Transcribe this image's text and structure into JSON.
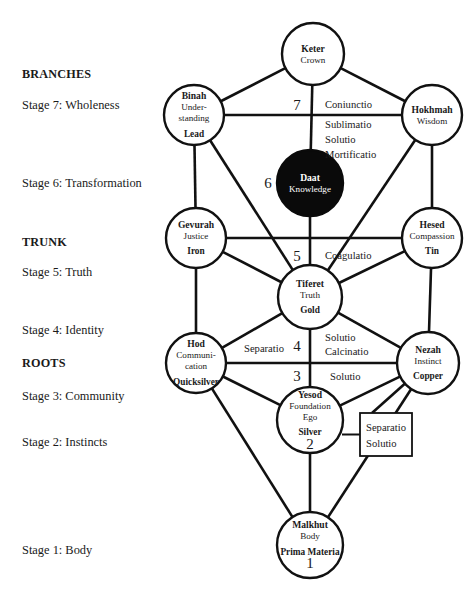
{
  "diagram": {
    "width": 472,
    "height": 589,
    "background_color": "#ffffff",
    "line_color": "#111111"
  },
  "left_panel": {
    "items": [
      {
        "label": "BRANCHES",
        "kind": "section",
        "x": 22,
        "y": 68
      },
      {
        "label": "Stage 7: Wholeness",
        "kind": "stage",
        "x": 22,
        "y": 99
      },
      {
        "label": "Stage 6: Transformation",
        "kind": "stage",
        "x": 22,
        "y": 177
      },
      {
        "label": "TRUNK",
        "kind": "section",
        "x": 22,
        "y": 236
      },
      {
        "label": "Stage 5: Truth",
        "kind": "stage",
        "x": 22,
        "y": 266
      },
      {
        "label": "Stage 4: Identity",
        "kind": "stage",
        "x": 22,
        "y": 324
      },
      {
        "label": "ROOTS",
        "kind": "section",
        "x": 22,
        "y": 357
      },
      {
        "label": "Stage 3: Community",
        "kind": "stage",
        "x": 22,
        "y": 390
      },
      {
        "label": "Stage 2: Instincts",
        "kind": "stage",
        "x": 22,
        "y": 436
      },
      {
        "label": "Stage 1: Body",
        "kind": "stage",
        "x": 22,
        "y": 544
      }
    ]
  },
  "nodes": [
    {
      "id": "keter",
      "name": "Keter",
      "subtitle": "Crown",
      "metal": "",
      "number": "",
      "cx": 313,
      "cy": 54,
      "r": 31,
      "filled": false
    },
    {
      "id": "binah",
      "name": "Binah",
      "subtitle": "Under-\nstanding",
      "metal": "Lead",
      "number": "",
      "cx": 194,
      "cy": 115,
      "r": 30,
      "filled": false
    },
    {
      "id": "hokhmah",
      "name": "Hokhmah",
      "subtitle": "Wisdom",
      "metal": "",
      "number": "",
      "cx": 432,
      "cy": 115,
      "r": 30,
      "filled": false
    },
    {
      "id": "daat",
      "name": "Daat",
      "subtitle": "Knowledge",
      "metal": "",
      "number": "",
      "cx": 310,
      "cy": 183,
      "r": 33,
      "filled": true
    },
    {
      "id": "gevurah",
      "name": "Gevurah",
      "subtitle": "Justice",
      "metal": "Iron",
      "number": "",
      "cx": 196,
      "cy": 238,
      "r": 30,
      "filled": false
    },
    {
      "id": "hesed",
      "name": "Hesed",
      "subtitle": "Compassion",
      "metal": "Tin",
      "number": "",
      "cx": 432,
      "cy": 238,
      "r": 30,
      "filled": false
    },
    {
      "id": "tiferet",
      "name": "Tiferet",
      "subtitle": "Truth",
      "metal": "Gold",
      "number": "",
      "cx": 310,
      "cy": 297,
      "r": 32,
      "filled": false
    },
    {
      "id": "hod",
      "name": "Hod",
      "subtitle": "Communi-\ncation",
      "metal": "Quicksilver",
      "number": "",
      "cx": 196,
      "cy": 363,
      "r": 30,
      "filled": false
    },
    {
      "id": "nezah",
      "name": "Nezah",
      "subtitle": "Instinct",
      "metal": "Copper",
      "number": "",
      "cx": 428,
      "cy": 363,
      "r": 31,
      "filled": false
    },
    {
      "id": "yesod",
      "name": "Yesod",
      "subtitle": "Foundation\nEgo",
      "metal": "Silver",
      "number": "2",
      "cx": 310,
      "cy": 420,
      "r": 33,
      "filled": false
    },
    {
      "id": "malkhut",
      "name": "Malkhut",
      "subtitle": "Body",
      "metal": "Prima Materia",
      "number": "1",
      "cx": 310,
      "cy": 545,
      "r": 33,
      "filled": false
    }
  ],
  "stage_numbers": [
    {
      "label": "7",
      "x": 297,
      "y": 110
    },
    {
      "label": "6",
      "x": 268,
      "y": 188
    },
    {
      "label": "5",
      "x": 297,
      "y": 261
    },
    {
      "label": "4",
      "x": 297,
      "y": 351
    },
    {
      "label": "3",
      "x": 297,
      "y": 381
    }
  ],
  "operations": [
    {
      "label": "Coniunctio",
      "x": 325,
      "y": 108,
      "anchor": "start"
    },
    {
      "label": "Sublimatio",
      "x": 325,
      "y": 128,
      "anchor": "start"
    },
    {
      "label": "Solutio",
      "x": 325,
      "y": 143,
      "anchor": "start"
    },
    {
      "label": "Mortificatio",
      "x": 325,
      "y": 158,
      "anchor": "start"
    },
    {
      "label": "Coagulatio",
      "x": 325,
      "y": 259,
      "anchor": "start"
    },
    {
      "label": "Separatio",
      "x": 244,
      "y": 352,
      "anchor": "start"
    },
    {
      "label": "Solutio",
      "x": 325,
      "y": 341,
      "anchor": "start"
    },
    {
      "label": "Calcinatio",
      "x": 325,
      "y": 355,
      "anchor": "start"
    },
    {
      "label": "Solutio",
      "x": 330,
      "y": 380,
      "anchor": "start"
    }
  ],
  "operation_box": {
    "x": 360,
    "y": 413,
    "width": 52,
    "height": 43,
    "lines": [
      "Separatio",
      "Solutio"
    ]
  },
  "edges": [
    {
      "from": "binah",
      "to": "keter"
    },
    {
      "from": "hokhmah",
      "to": "keter"
    },
    {
      "from": "binah",
      "to": "hokhmah"
    },
    {
      "from": "keter",
      "to": "daat"
    },
    {
      "from": "binah",
      "to": "gevurah"
    },
    {
      "from": "hokhmah",
      "to": "hesed"
    },
    {
      "from": "binah",
      "to": "tiferet"
    },
    {
      "from": "hokhmah",
      "to": "tiferet"
    },
    {
      "from": "daat",
      "to": "tiferet"
    },
    {
      "from": "gevurah",
      "to": "hesed"
    },
    {
      "from": "gevurah",
      "to": "tiferet"
    },
    {
      "from": "hesed",
      "to": "tiferet"
    },
    {
      "from": "gevurah",
      "to": "hod"
    },
    {
      "from": "hesed",
      "to": "nezah"
    },
    {
      "from": "tiferet",
      "to": "hod"
    },
    {
      "from": "tiferet",
      "to": "nezah"
    },
    {
      "from": "tiferet",
      "to": "yesod"
    },
    {
      "from": "hod",
      "to": "nezah"
    },
    {
      "from": "hod",
      "to": "yesod"
    },
    {
      "from": "nezah",
      "to": "yesod"
    },
    {
      "from": "hod",
      "to": "malkhut"
    },
    {
      "from": "nezah",
      "to": "malkhut"
    },
    {
      "from": "yesod",
      "to": "malkhut"
    }
  ],
  "box_connectors": [
    {
      "from_node": "yesod",
      "to_box_side": "left"
    },
    {
      "from_node": "nezah",
      "to_box_point": {
        "x": 372,
        "y": 413
      }
    }
  ]
}
